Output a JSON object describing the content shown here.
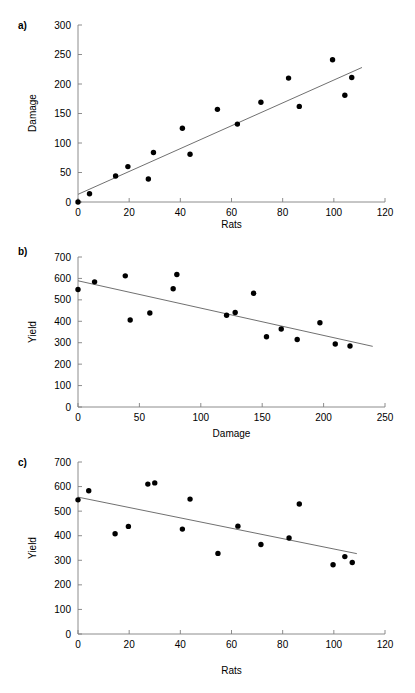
{
  "figure": {
    "background": "#ffffff",
    "point_color": "#000000",
    "line_color": "#606060",
    "axis_color": "#808080",
    "width": 415,
    "height": 693
  },
  "panels": [
    {
      "id": "a",
      "label": "a)"
    },
    {
      "id": "b",
      "label": "b)"
    },
    {
      "id": "c",
      "label": "c)"
    }
  ],
  "chart_data": [
    {
      "type": "scatter",
      "panel": "a",
      "title": "",
      "xlabel": "Rats",
      "ylabel": "Damage",
      "xlim": [
        0,
        120
      ],
      "ylim": [
        0,
        300
      ],
      "xticks": [
        0,
        20,
        40,
        60,
        80,
        100,
        120
      ],
      "yticks": [
        0,
        50,
        100,
        150,
        200,
        250,
        300
      ],
      "grid": false,
      "legend": "none",
      "x": [
        0,
        4.5,
        14.7,
        19.5,
        27.5,
        29.5,
        40.8,
        43.8,
        54.5,
        62.3,
        71.5,
        82.3,
        86.5,
        99.5,
        104.3,
        107.0
      ],
      "y": [
        0,
        14,
        44,
        60,
        39,
        84,
        125,
        81,
        157,
        132,
        169,
        210,
        162,
        241,
        181,
        211
      ],
      "trendline": {
        "x": [
          0,
          111
        ],
        "y": [
          13,
          228
        ]
      }
    },
    {
      "type": "scatter",
      "panel": "b",
      "title": "",
      "xlabel": "Damage",
      "ylabel": "Yield",
      "xlim": [
        0,
        250
      ],
      "ylim": [
        0,
        700
      ],
      "xticks": [
        0,
        50,
        100,
        150,
        200,
        250
      ],
      "yticks": [
        0,
        100,
        200,
        300,
        400,
        500,
        600,
        700
      ],
      "grid": false,
      "legend": "none",
      "x": [
        0,
        13.5,
        38.5,
        42.5,
        58.5,
        77.5,
        80.5,
        121.0,
        128.0,
        143.0,
        153.5,
        165.5,
        178.5,
        197.0,
        209.5,
        221.5
      ],
      "y": [
        548,
        584,
        612,
        406,
        439,
        552,
        618,
        428,
        441,
        531,
        328,
        364,
        315,
        393,
        294,
        285
      ],
      "trendline": {
        "x": [
          0,
          240
        ],
        "y": [
          589,
          283
        ]
      }
    },
    {
      "type": "scatter",
      "panel": "c",
      "title": "",
      "xlabel": "Rats",
      "ylabel": "Yield",
      "xlim": [
        0,
        120
      ],
      "ylim": [
        0,
        700
      ],
      "xticks": [
        0,
        20,
        40,
        60,
        80,
        100,
        120
      ],
      "yticks": [
        0,
        100,
        200,
        300,
        400,
        500,
        600,
        700
      ],
      "grid": false,
      "legend": "none",
      "x": [
        0,
        4.2,
        14.5,
        19.7,
        27.3,
        30.0,
        40.8,
        43.8,
        54.7,
        62.5,
        71.5,
        82.5,
        86.5,
        99.7,
        104.3,
        107.2
      ],
      "y": [
        546,
        583,
        408,
        438,
        610,
        615,
        427,
        549,
        328,
        439,
        364,
        391,
        529,
        282,
        315,
        291
      ],
      "trendline": {
        "x": [
          0,
          109
        ],
        "y": [
          557,
          327
        ]
      }
    }
  ]
}
